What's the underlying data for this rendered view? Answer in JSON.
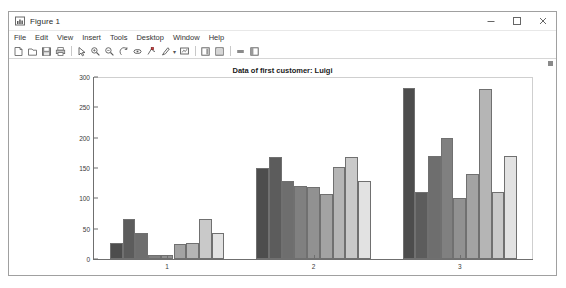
{
  "window": {
    "title": "Figure 1",
    "icon": "figure-icon",
    "controls": [
      {
        "name": "minimize-button",
        "glyph": "minimize-icon"
      },
      {
        "name": "maximize-button",
        "glyph": "maximize-icon"
      },
      {
        "name": "close-button",
        "glyph": "close-icon"
      }
    ]
  },
  "menu": {
    "items": [
      {
        "label": "File"
      },
      {
        "label": "Edit"
      },
      {
        "label": "View"
      },
      {
        "label": "Insert"
      },
      {
        "label": "Tools"
      },
      {
        "label": "Desktop"
      },
      {
        "label": "Window"
      },
      {
        "label": "Help"
      }
    ]
  },
  "toolbar": {
    "buttons": [
      {
        "name": "new-figure-icon"
      },
      {
        "name": "open-file-icon"
      },
      {
        "name": "save-figure-icon"
      },
      {
        "name": "print-figure-icon"
      },
      {
        "name": "separator"
      },
      {
        "name": "edit-plot-pointer-icon"
      },
      {
        "name": "zoom-in-icon"
      },
      {
        "name": "zoom-out-icon"
      },
      {
        "name": "pan-icon"
      },
      {
        "name": "rotate-3d-icon"
      },
      {
        "name": "data-cursor-icon"
      },
      {
        "name": "brush-data-icon"
      },
      {
        "name": "brush-dropdown-caret"
      },
      {
        "name": "link-plot-icon"
      },
      {
        "name": "separator"
      },
      {
        "name": "insert-colorbar-icon"
      },
      {
        "name": "insert-legend-icon"
      },
      {
        "name": "separator"
      },
      {
        "name": "hide-plot-tools-icon"
      },
      {
        "name": "show-plot-tools-icon"
      }
    ]
  },
  "chart_data": {
    "type": "bar",
    "title": "Data of first customer: Luigi",
    "xlabel": "",
    "ylabel": "",
    "categories": [
      "1",
      "2",
      "3"
    ],
    "ytick_labels": [
      "0",
      "50",
      "100",
      "150",
      "200",
      "250",
      "300"
    ],
    "ytick_values": [
      0,
      50,
      100,
      150,
      200,
      250,
      300
    ],
    "ylim": [
      0,
      300
    ],
    "grid": false,
    "legend": "none",
    "bars_per_group": 9,
    "series_colors": [
      "#4d4d4d",
      "#5c5c5c",
      "#6e6e6e",
      "#808080",
      "#919191",
      "#a3a3a3",
      "#b5b5b5",
      "#c9c9c9",
      "#e2e2e2"
    ],
    "series": [
      {
        "name": "Series 1",
        "values": [
          26,
          150,
          282
        ]
      },
      {
        "name": "Series 2",
        "values": [
          66,
          168,
          111
        ]
      },
      {
        "name": "Series 3",
        "values": [
          43,
          128,
          170
        ]
      },
      {
        "name": "Series 4",
        "values": [
          6,
          120,
          200
        ]
      },
      {
        "name": "Series 5",
        "values": [
          6,
          119,
          100
        ]
      },
      {
        "name": "Series 6",
        "values": [
          24,
          107,
          140
        ]
      },
      {
        "name": "Series 7",
        "values": [
          26,
          151,
          281
        ]
      },
      {
        "name": "Series 8",
        "values": [
          66,
          168,
          111
        ]
      },
      {
        "name": "Series 9",
        "values": [
          43,
          128,
          170
        ]
      }
    ]
  }
}
